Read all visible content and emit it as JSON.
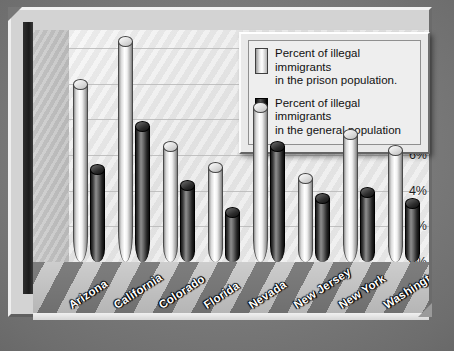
{
  "chart_data": {
    "type": "bar",
    "title": "",
    "subtitle": "",
    "xlabel": "",
    "ylabel": "",
    "ylim": [
      0,
      13
    ],
    "ytick_labels": [
      "12%",
      "10%",
      "8%",
      "6%",
      "4%",
      "2%",
      "0%"
    ],
    "ytick_values": [
      12,
      10,
      8,
      6,
      4,
      2,
      0
    ],
    "grid": true,
    "legend_position": "top-right",
    "categories": [
      "Arizona",
      "California",
      "Colorado",
      "Florida",
      "Nevada",
      "New Jersey",
      "New York",
      "Washington"
    ],
    "series": [
      {
        "name": "Percent of illegal immigrants in the prison population.",
        "legend_line_1": "Percent of illegal immigrants",
        "legend_line_2": "in the prison population.",
        "style": "light",
        "values": [
          10.0,
          12.4,
          6.5,
          5.3,
          8.7,
          4.7,
          7.2,
          6.3
        ]
      },
      {
        "name": "Percent of illegal immigrants in the general population",
        "legend_line_1": "Percent of illegal immigrants",
        "legend_line_2": "in the general population",
        "style": "dark",
        "values": [
          5.2,
          7.6,
          4.3,
          2.8,
          6.5,
          3.6,
          3.9,
          3.3
        ]
      }
    ]
  },
  "colors": {
    "background": "#6e6e6e",
    "frame": "#d3d3d3",
    "plot_background": "#ededed",
    "gridline": "#b9b9b9",
    "series_light": "#f2f2f2",
    "series_dark": "#1a1a1a",
    "axis_label": "#1d1d1d",
    "category_label": "#fdfdfd"
  }
}
